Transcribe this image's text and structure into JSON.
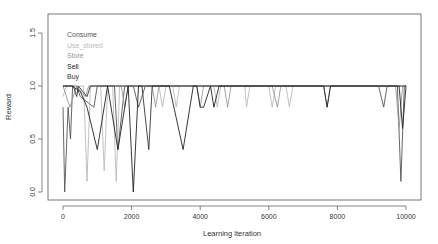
{
  "chart_data": {
    "type": "line",
    "title": "",
    "xlabel": "Learning iteration",
    "ylabel": "Reward",
    "xlim": [
      -400,
      10400
    ],
    "ylim": [
      -0.05,
      1.65
    ],
    "x_ticks": [
      0,
      2000,
      4000,
      6000,
      8000,
      10000
    ],
    "x_tick_labels": [
      "0",
      "2000",
      "4000",
      "6000",
      "8000",
      "10000"
    ],
    "y_ticks": [
      0.0,
      0.5,
      1.0,
      1.5
    ],
    "y_tick_labels": [
      "0.0",
      "0.5",
      "1.0",
      "1.5"
    ],
    "grid": false,
    "legend_position": "top-left (inside plot)",
    "legend": [
      {
        "name": "Consume",
        "color": "#555555"
      },
      {
        "name": "Use_stored",
        "color": "#bbbbbb"
      },
      {
        "name": "Store",
        "color": "#999999"
      },
      {
        "name": "Sell",
        "color": "#222222"
      },
      {
        "name": "Buy",
        "color": "#333333"
      }
    ],
    "series": [
      {
        "name": "Consume",
        "color": "#555555",
        "points": [
          [
            0,
            0.8
          ],
          [
            50,
            0.0
          ],
          [
            150,
            0.8
          ],
          [
            220,
            0.5
          ],
          [
            280,
            1.0
          ],
          [
            400,
            1.0
          ],
          [
            500,
            0.9
          ],
          [
            900,
            0.8
          ],
          [
            1000,
            1.0
          ],
          [
            1500,
            1.0
          ],
          [
            1600,
            0.4
          ],
          [
            1800,
            1.0
          ],
          [
            2050,
            1.0
          ],
          [
            2200,
            0.8
          ],
          [
            2400,
            1.0
          ],
          [
            9200,
            1.0
          ],
          [
            9350,
            0.8
          ],
          [
            9450,
            1.0
          ],
          [
            9750,
            1.0
          ],
          [
            9850,
            0.1
          ],
          [
            9950,
            1.0
          ],
          [
            10000,
            1.0
          ]
        ]
      },
      {
        "name": "Use_stored",
        "color": "#bbbbbb",
        "points": [
          [
            0,
            0.9
          ],
          [
            100,
            1.0
          ],
          [
            600,
            1.0
          ],
          [
            700,
            0.1
          ],
          [
            800,
            1.0
          ],
          [
            1100,
            1.0
          ],
          [
            1200,
            0.2
          ],
          [
            1300,
            1.0
          ],
          [
            1450,
            1.0
          ],
          [
            1550,
            0.1
          ],
          [
            1650,
            1.0
          ],
          [
            2800,
            1.0
          ],
          [
            2900,
            0.8
          ],
          [
            3000,
            1.0
          ],
          [
            3200,
            1.0
          ],
          [
            3300,
            0.8
          ],
          [
            3400,
            1.0
          ],
          [
            4400,
            1.0
          ],
          [
            4500,
            0.8
          ],
          [
            4600,
            1.0
          ],
          [
            5300,
            1.0
          ],
          [
            5350,
            0.8
          ],
          [
            5450,
            1.0
          ],
          [
            6000,
            1.0
          ],
          [
            6100,
            0.8
          ],
          [
            6200,
            1.0
          ],
          [
            6500,
            1.0
          ],
          [
            6600,
            0.8
          ],
          [
            6700,
            1.0
          ],
          [
            10000,
            1.0
          ]
        ]
      },
      {
        "name": "Store",
        "color": "#999999",
        "points": [
          [
            0,
            1.0
          ],
          [
            200,
            0.8
          ],
          [
            400,
            1.0
          ],
          [
            650,
            0.9
          ],
          [
            750,
            1.0
          ],
          [
            1700,
            1.0
          ],
          [
            1800,
            0.8
          ],
          [
            1900,
            1.0
          ],
          [
            2600,
            1.0
          ],
          [
            2700,
            0.8
          ],
          [
            2800,
            1.0
          ],
          [
            3900,
            1.0
          ],
          [
            4000,
            0.8
          ],
          [
            4100,
            1.0
          ],
          [
            4700,
            1.0
          ],
          [
            4800,
            0.8
          ],
          [
            4900,
            1.0
          ],
          [
            6100,
            1.0
          ],
          [
            6250,
            0.8
          ],
          [
            6350,
            1.0
          ],
          [
            7600,
            1.0
          ],
          [
            7700,
            0.8
          ],
          [
            7800,
            1.0
          ],
          [
            9700,
            1.0
          ],
          [
            9800,
            0.6
          ],
          [
            9900,
            1.0
          ],
          [
            10000,
            1.0
          ]
        ]
      },
      {
        "name": "Sell",
        "color": "#222222",
        "points": [
          [
            0,
            1.0
          ],
          [
            250,
            1.0
          ],
          [
            500,
            0.95
          ],
          [
            700,
            0.8
          ],
          [
            1000,
            0.4
          ],
          [
            1300,
            1.0
          ],
          [
            1600,
            0.4
          ],
          [
            1900,
            1.0
          ],
          [
            2050,
            0.0
          ],
          [
            2200,
            1.0
          ],
          [
            3100,
            1.0
          ],
          [
            3500,
            0.4
          ],
          [
            3800,
            1.0
          ],
          [
            3900,
            1.0
          ],
          [
            4000,
            0.8
          ],
          [
            4100,
            0.8
          ],
          [
            4300,
            1.0
          ],
          [
            4400,
            0.8
          ],
          [
            4550,
            1.0
          ],
          [
            7600,
            1.0
          ],
          [
            7700,
            0.8
          ],
          [
            7800,
            1.0
          ],
          [
            9800,
            1.0
          ],
          [
            9900,
            0.6
          ],
          [
            10000,
            1.0
          ]
        ]
      },
      {
        "name": "Buy",
        "color": "#333333",
        "points": [
          [
            0,
            1.0
          ],
          [
            300,
            1.0
          ],
          [
            400,
            0.9
          ],
          [
            450,
            1.0
          ],
          [
            700,
            0.9
          ],
          [
            800,
            1.0
          ],
          [
            2300,
            1.0
          ],
          [
            2500,
            0.4
          ],
          [
            2600,
            1.0
          ],
          [
            10000,
            1.0
          ]
        ]
      }
    ]
  },
  "plot": {
    "box": {
      "left": 48,
      "top": 14,
      "right": 421,
      "bottom": 200
    },
    "x_map": {
      "v0": 0,
      "px0": 63,
      "v1": 10000,
      "px1": 406
    },
    "y_map": {
      "v0": 0.0,
      "px0": 192,
      "v1": 1.0,
      "px1": 86
    }
  }
}
